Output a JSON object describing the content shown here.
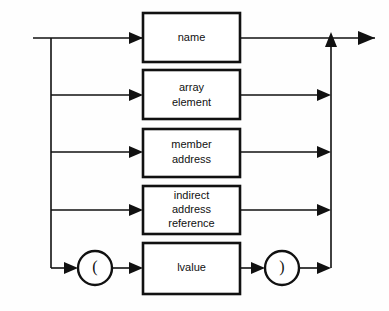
{
  "diagram": {
    "kind": "railroad-syntax-diagram",
    "title": "lvalue",
    "background_color": "#fefefe",
    "line_color": "#111111",
    "box_fill": "#ffffff",
    "entry_label": "",
    "exit_label": "",
    "alternatives": [
      {
        "id": "name",
        "shape": "box",
        "lines": [
          "name"
        ],
        "text": "name"
      },
      {
        "id": "array-element",
        "shape": "box",
        "lines": [
          "array",
          "element"
        ],
        "text": "array element"
      },
      {
        "id": "member-address",
        "shape": "box",
        "lines": [
          "member",
          "address"
        ],
        "text": "member address"
      },
      {
        "id": "indirect-address-reference",
        "shape": "box",
        "lines": [
          "indirect",
          "address",
          "reference"
        ],
        "text": "indirect address reference"
      },
      {
        "id": "parenthesized-lvalue",
        "shape": "sequence",
        "parts": [
          {
            "id": "open-paren",
            "shape": "circle",
            "text": "("
          },
          {
            "id": "lvalue",
            "shape": "box",
            "lines": [
              "lvalue"
            ],
            "text": "lvalue"
          },
          {
            "id": "close-paren",
            "shape": "circle",
            "text": ")"
          }
        ]
      }
    ]
  },
  "geometry": {
    "width": 389,
    "height": 311,
    "entry_x": 33,
    "fan_x": 51,
    "box_left": 143,
    "box_right": 240,
    "merge_x": 331,
    "exit_x": 375,
    "rows": [
      {
        "id": "name",
        "y": 38,
        "box_top": 13,
        "box_bottom": 62
      },
      {
        "id": "array-element",
        "y": 95,
        "box_top": 70,
        "box_bottom": 119
      },
      {
        "id": "member-address",
        "y": 152,
        "box_top": 129,
        "box_bottom": 177
      },
      {
        "id": "indirect-address-reference",
        "y": 210,
        "box_top": 186,
        "box_bottom": 234
      },
      {
        "id": "parenthesized-lvalue",
        "y": 268,
        "box_top": 243,
        "box_bottom": 294
      }
    ],
    "open_paren_cx": 95,
    "close_paren_cx": 282,
    "paren_r": 17
  }
}
